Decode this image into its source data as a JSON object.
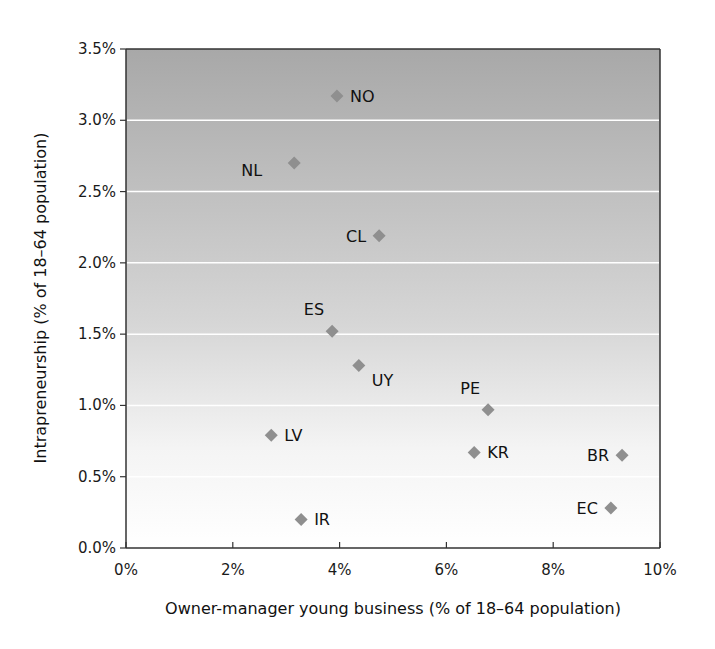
{
  "chart_data": {
    "type": "scatter",
    "title": "",
    "xlabel": "Owner-manager young business (% of 18–64 population)",
    "ylabel": "Intrapreneurship (% of 18–64 population)",
    "xlim": [
      0,
      10
    ],
    "ylim": [
      0,
      3.5
    ],
    "x_ticks": [
      0,
      2,
      4,
      6,
      8,
      10
    ],
    "x_tick_labels": [
      "0%",
      "2%",
      "4%",
      "6%",
      "8%",
      "10%"
    ],
    "y_ticks": [
      0,
      0.5,
      1.0,
      1.5,
      2.0,
      2.5,
      3.0,
      3.5
    ],
    "y_tick_labels": [
      "0.0%",
      "0.5%",
      "1.0%",
      "1.5%",
      "2.0%",
      "2.5%",
      "3.0%",
      "3.5%"
    ],
    "grid": {
      "horizontal": true,
      "vertical": false,
      "color": "#ffffff"
    },
    "background_gradient": {
      "top": "#a8a8a8",
      "bottom": "#ffffff"
    },
    "marker": {
      "shape": "diamond",
      "color": "#8f8f8f"
    },
    "legend": null,
    "points": [
      {
        "label": "NO",
        "x": 3.95,
        "y": 3.17,
        "label_pos": "right"
      },
      {
        "label": "NL",
        "x": 3.15,
        "y": 2.7,
        "label_pos": "left-below"
      },
      {
        "label": "CL",
        "x": 4.74,
        "y": 2.19,
        "label_pos": "left"
      },
      {
        "label": "ES",
        "x": 3.86,
        "y": 1.52,
        "label_pos": "above-left"
      },
      {
        "label": "UY",
        "x": 4.36,
        "y": 1.28,
        "label_pos": "right-below"
      },
      {
        "label": "PE",
        "x": 6.78,
        "y": 0.97,
        "label_pos": "above-left"
      },
      {
        "label": "KR",
        "x": 6.52,
        "y": 0.67,
        "label_pos": "right"
      },
      {
        "label": "BR",
        "x": 9.29,
        "y": 0.65,
        "label_pos": "left"
      },
      {
        "label": "EC",
        "x": 9.08,
        "y": 0.28,
        "label_pos": "left"
      },
      {
        "label": "LV",
        "x": 2.72,
        "y": 0.79,
        "label_pos": "right"
      },
      {
        "label": "IR",
        "x": 3.28,
        "y": 0.2,
        "label_pos": "right"
      }
    ]
  }
}
